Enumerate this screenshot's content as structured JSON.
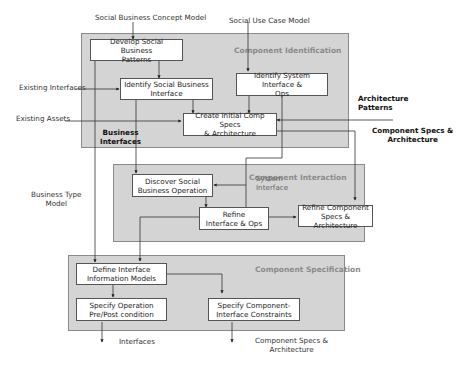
{
  "regions": {
    "identification": {
      "title": "Component Identification"
    },
    "interaction": {
      "title": "Component Interaction"
    },
    "specification": {
      "title": "Component Specification"
    }
  },
  "boxes": {
    "develop_patterns": "Develop Social Business\nPatterns",
    "identify_social_interface": "Identify  Social Business\nInterface",
    "identify_system_interface": "Identify System Interface &\nOps",
    "create_initial_specs": "Create Initial Comp Specs\n& Architecture",
    "discover_operation": "Discover Social\nBusiness Operation",
    "refine_interface": "Refine\nInterface & Ops",
    "refine_component_specs": "Refine Component\nSpecs & Architecture",
    "define_info_models": "Define Interface\nInformation Models",
    "specify_operation": "Specify Operation\nPre/Post condition",
    "specify_constraints": "Specify Component-\nInterface Constraints"
  },
  "inputs": {
    "social_business_concept_model": "Social Business Concept Model",
    "social_use_case_model": "Social Use Case Model",
    "existing_interfaces": "Existing Interfaces",
    "existing_assets": "Existing Assets",
    "architecture_patterns": "Architecture\nPatterns",
    "business_type_model": "Business Type\nModel"
  },
  "flow_labels": {
    "business_interfaces": "Business\nInterfaces",
    "system_interface": "System\nInterface",
    "component_specs_out_right": "Component Specs &\nArchitecture"
  },
  "outputs": {
    "interfaces": "Interfaces",
    "component_specs": "Component Specs &\nArchitecture"
  }
}
